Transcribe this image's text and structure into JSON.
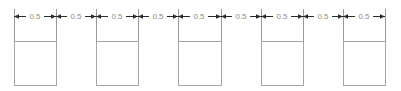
{
  "drawing": {
    "type": "dimensioned-technical-drawing",
    "canvas": {
      "width": 401,
      "height": 91,
      "background": "#ffffff"
    },
    "colors": {
      "dimension_line": "#2b2b2b",
      "extension_line": "#9a9a9a",
      "box_stroke": "#a6a6a6",
      "text": "#8c8c8c",
      "background": "#ffffff"
    },
    "dimension_row": {
      "label": "Dimension chain",
      "y": 16,
      "unit": "",
      "count": 9,
      "segments": [
        {
          "index": 1,
          "value": "0.5",
          "x_start": 14,
          "x_end": 56,
          "text_x": 35
        },
        {
          "index": 2,
          "value": "0.5",
          "x_start": 56,
          "x_end": 96,
          "text_x": 76
        },
        {
          "index": 3,
          "value": "0.5",
          "x_start": 96,
          "x_end": 138,
          "text_x": 117
        },
        {
          "index": 4,
          "value": "0.5",
          "x_start": 138,
          "x_end": 178,
          "text_x": 158
        },
        {
          "index": 5,
          "value": "0.5",
          "x_start": 178,
          "x_end": 221,
          "text_x": 199
        },
        {
          "index": 6,
          "value": "0.5",
          "x_start": 221,
          "x_end": 261,
          "text_x": 241
        },
        {
          "index": 7,
          "value": "0.5",
          "x_start": 261,
          "x_end": 303,
          "text_x": 282
        },
        {
          "index": 8,
          "value": "0.5",
          "x_start": 303,
          "x_end": 343,
          "text_x": 323
        },
        {
          "index": 9,
          "value": "0.5",
          "x_start": 343,
          "x_end": 385,
          "text_x": 364
        }
      ]
    },
    "extension_lines": [
      {
        "index": 1,
        "x": 14,
        "y_top": 9,
        "y_bottom": 41
      },
      {
        "index": 2,
        "x": 56,
        "y_top": 9,
        "y_bottom": 41
      },
      {
        "index": 3,
        "x": 96,
        "y_top": 9,
        "y_bottom": 41
      },
      {
        "index": 4,
        "x": 138,
        "y_top": 9,
        "y_bottom": 41
      },
      {
        "index": 5,
        "x": 178,
        "y_top": 9,
        "y_bottom": 41
      },
      {
        "index": 6,
        "x": 221,
        "y_top": 9,
        "y_bottom": 41
      },
      {
        "index": 7,
        "x": 261,
        "y_top": 9,
        "y_bottom": 41
      },
      {
        "index": 8,
        "x": 303,
        "y_top": 9,
        "y_bottom": 41
      },
      {
        "index": 9,
        "x": 343,
        "y_top": 9,
        "y_bottom": 41
      },
      {
        "index": 10,
        "x": 385,
        "y_top": 9,
        "y_bottom": 41
      }
    ],
    "boxes": [
      {
        "index": 1,
        "x": 14,
        "y": 41,
        "width": 42,
        "height": 44
      },
      {
        "index": 2,
        "x": 96,
        "y": 41,
        "width": 42,
        "height": 44
      },
      {
        "index": 3,
        "x": 178,
        "y": 41,
        "width": 43,
        "height": 44
      },
      {
        "index": 4,
        "x": 261,
        "y": 41,
        "width": 42,
        "height": 44
      },
      {
        "index": 5,
        "x": 343,
        "y": 41,
        "width": 42,
        "height": 44
      }
    ]
  }
}
